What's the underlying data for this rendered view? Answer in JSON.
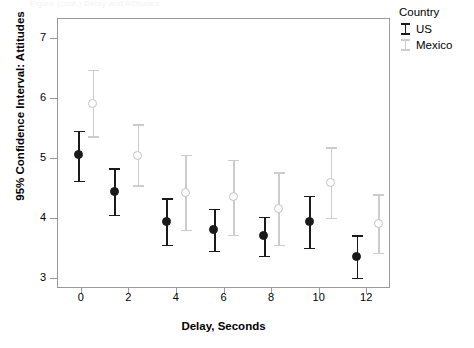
{
  "ghost_title": "Figure  (cont.)  Delay and Attitudes",
  "legend": {
    "title": "Country",
    "items": [
      {
        "label": "US",
        "color": "#1a1a1a",
        "marker": "filled-circle"
      },
      {
        "label": "Mexico",
        "color": "#cccccc",
        "marker": "open-circle"
      }
    ]
  },
  "axes": {
    "ylabel": "95% Confidence Interval: Attitudes",
    "xlabel": "Delay, Seconds",
    "yticks": [
      "3",
      "4",
      "5",
      "6",
      "7"
    ],
    "xticks": [
      "0",
      "2",
      "4",
      "6",
      "8",
      "10",
      "12"
    ]
  },
  "chart_data": {
    "type": "scatter",
    "title": "",
    "xlabel": "Delay, Seconds",
    "ylabel": "95% Confidence Interval: Attitudes",
    "xlim": [
      -1.0,
      13.0
    ],
    "ylim": [
      2.83,
      7.33
    ],
    "grid": false,
    "legend_position": "right",
    "legend_title": "Country",
    "error_bars": "95% confidence interval",
    "series": [
      {
        "name": "US",
        "marker": "filled-circle",
        "color": "#1a1a1a",
        "x": [
          -0.1,
          1.4,
          3.6,
          5.6,
          7.7,
          9.6,
          11.6
        ],
        "values": [
          5.05,
          4.44,
          3.94,
          3.8,
          3.7,
          3.94,
          3.36
        ],
        "ci_lower": [
          4.62,
          4.05,
          3.55,
          3.45,
          3.37,
          3.5,
          3.0
        ],
        "ci_upper": [
          5.45,
          4.83,
          4.33,
          4.15,
          4.02,
          4.37,
          3.71
        ]
      },
      {
        "name": "Mexico",
        "marker": "open-circle",
        "color": "#cccccc",
        "x": [
          0.5,
          2.4,
          4.4,
          6.4,
          8.3,
          10.5,
          12.5
        ],
        "values": [
          5.9,
          5.04,
          4.42,
          4.35,
          4.15,
          4.59,
          3.9
        ],
        "ci_lower": [
          5.36,
          4.54,
          3.8,
          3.72,
          3.55,
          4.0,
          3.42
        ],
        "ci_upper": [
          6.47,
          5.56,
          5.05,
          4.97,
          4.76,
          5.18,
          4.39
        ]
      }
    ]
  }
}
